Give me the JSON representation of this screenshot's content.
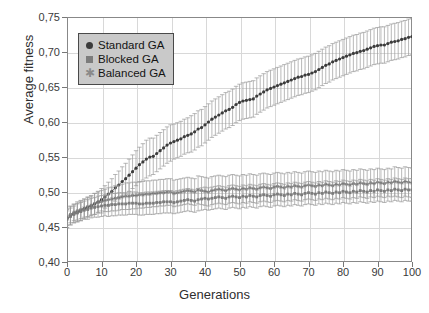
{
  "chart_data": {
    "type": "line",
    "title": "",
    "xlabel": "Generations",
    "ylabel": "Average fitness",
    "xlim": [
      0,
      100
    ],
    "ylim": [
      0.4,
      0.75
    ],
    "xticks": [
      "0",
      "10",
      "20",
      "30",
      "40",
      "50",
      "60",
      "70",
      "80",
      "90",
      "100"
    ],
    "xtick_values": [
      0,
      10,
      20,
      30,
      40,
      50,
      60,
      70,
      80,
      90,
      100
    ],
    "yticks": [
      "0,40",
      "0,45",
      "0,50",
      "0,55",
      "0,60",
      "0,65",
      "0,70",
      "0,75"
    ],
    "ytick_values": [
      0.4,
      0.45,
      0.5,
      0.55,
      0.6,
      0.65,
      0.7,
      0.75
    ],
    "grid": true,
    "decimal_separator": ",",
    "legend_position": "upper-left",
    "legend": [
      {
        "label": "Standard GA",
        "marker": "circle",
        "color": "#3b3b3b"
      },
      {
        "label": "Blocked GA",
        "marker": "square",
        "color": "#7c7c7c"
      },
      {
        "label": "Balanced GA",
        "marker": "star",
        "color": "#8a8a8a"
      }
    ],
    "errorbars": true,
    "x": [
      0,
      1,
      2,
      3,
      4,
      5,
      6,
      7,
      8,
      9,
      10,
      11,
      12,
      13,
      14,
      15,
      16,
      17,
      18,
      19,
      20,
      21,
      22,
      23,
      24,
      25,
      26,
      27,
      28,
      29,
      30,
      31,
      32,
      33,
      34,
      35,
      36,
      37,
      38,
      39,
      40,
      41,
      42,
      43,
      44,
      45,
      46,
      47,
      48,
      49,
      50,
      51,
      52,
      53,
      54,
      55,
      56,
      57,
      58,
      59,
      60,
      61,
      62,
      63,
      64,
      65,
      66,
      67,
      68,
      69,
      70,
      71,
      72,
      73,
      74,
      75,
      76,
      77,
      78,
      79,
      80,
      81,
      82,
      83,
      84,
      85,
      86,
      87,
      88,
      89,
      90,
      91,
      92,
      93,
      94,
      95,
      96,
      97,
      98,
      99,
      100
    ],
    "series": [
      {
        "name": "Standard GA",
        "marker": "circle",
        "color": "#3b3b3b",
        "values": [
          0.462,
          0.466,
          0.469,
          0.471,
          0.473,
          0.476,
          0.478,
          0.48,
          0.483,
          0.486,
          0.489,
          0.493,
          0.497,
          0.501,
          0.506,
          0.51,
          0.515,
          0.519,
          0.524,
          0.529,
          0.534,
          0.539,
          0.543,
          0.547,
          0.55,
          0.551,
          0.555,
          0.559,
          0.563,
          0.567,
          0.57,
          0.572,
          0.574,
          0.576,
          0.579,
          0.581,
          0.583,
          0.586,
          0.59,
          0.592,
          0.596,
          0.6,
          0.604,
          0.607,
          0.61,
          0.613,
          0.616,
          0.618,
          0.621,
          0.625,
          0.628,
          0.63,
          0.631,
          0.632,
          0.633,
          0.637,
          0.64,
          0.643,
          0.646,
          0.648,
          0.65,
          0.652,
          0.654,
          0.656,
          0.658,
          0.66,
          0.662,
          0.664,
          0.665,
          0.667,
          0.668,
          0.67,
          0.672,
          0.675,
          0.678,
          0.681,
          0.683,
          0.686,
          0.688,
          0.69,
          0.692,
          0.694,
          0.696,
          0.698,
          0.699,
          0.701,
          0.702,
          0.704,
          0.706,
          0.708,
          0.709,
          0.71,
          0.71,
          0.712,
          0.714,
          0.715,
          0.716,
          0.718,
          0.719,
          0.721,
          0.722
        ],
        "err_lower": [
          0.013,
          0.013,
          0.013,
          0.013,
          0.014,
          0.014,
          0.014,
          0.014,
          0.015,
          0.015,
          0.016,
          0.016,
          0.017,
          0.018,
          0.019,
          0.02,
          0.021,
          0.022,
          0.023,
          0.024,
          0.025,
          0.025,
          0.026,
          0.027,
          0.027,
          0.026,
          0.026,
          0.026,
          0.026,
          0.026,
          0.026,
          0.025,
          0.025,
          0.025,
          0.025,
          0.025,
          0.026,
          0.026,
          0.026,
          0.026,
          0.026,
          0.026,
          0.026,
          0.026,
          0.026,
          0.026,
          0.026,
          0.026,
          0.026,
          0.026,
          0.026,
          0.026,
          0.026,
          0.026,
          0.026,
          0.026,
          0.026,
          0.026,
          0.026,
          0.026,
          0.026,
          0.026,
          0.026,
          0.026,
          0.026,
          0.026,
          0.026,
          0.026,
          0.026,
          0.026,
          0.026,
          0.026,
          0.026,
          0.026,
          0.026,
          0.026,
          0.026,
          0.026,
          0.026,
          0.026,
          0.026,
          0.026,
          0.026,
          0.026,
          0.026,
          0.026,
          0.026,
          0.026,
          0.026,
          0.026,
          0.026,
          0.026,
          0.026,
          0.026,
          0.026,
          0.026,
          0.026,
          0.026,
          0.026,
          0.026,
          0.026
        ],
        "err_upper": [
          0.013,
          0.013,
          0.013,
          0.013,
          0.014,
          0.014,
          0.014,
          0.014,
          0.015,
          0.015,
          0.016,
          0.016,
          0.017,
          0.018,
          0.019,
          0.02,
          0.021,
          0.022,
          0.023,
          0.024,
          0.025,
          0.025,
          0.026,
          0.027,
          0.027,
          0.026,
          0.026,
          0.026,
          0.026,
          0.026,
          0.026,
          0.025,
          0.025,
          0.025,
          0.025,
          0.025,
          0.026,
          0.026,
          0.026,
          0.026,
          0.026,
          0.026,
          0.026,
          0.026,
          0.026,
          0.026,
          0.026,
          0.026,
          0.026,
          0.026,
          0.026,
          0.026,
          0.026,
          0.026,
          0.026,
          0.026,
          0.026,
          0.026,
          0.026,
          0.026,
          0.026,
          0.026,
          0.026,
          0.026,
          0.026,
          0.026,
          0.026,
          0.026,
          0.026,
          0.026,
          0.026,
          0.026,
          0.026,
          0.026,
          0.026,
          0.026,
          0.026,
          0.026,
          0.026,
          0.026,
          0.026,
          0.026,
          0.026,
          0.026,
          0.026,
          0.026,
          0.026,
          0.026,
          0.026,
          0.026,
          0.026,
          0.026,
          0.026,
          0.026,
          0.026,
          0.026,
          0.026,
          0.026,
          0.026,
          0.026,
          0.026
        ]
      },
      {
        "name": "Balanced GA",
        "marker": "star",
        "color": "#6a6a6a",
        "values": [
          0.464,
          0.468,
          0.471,
          0.473,
          0.475,
          0.477,
          0.479,
          0.481,
          0.483,
          0.485,
          0.486,
          0.488,
          0.489,
          0.49,
          0.491,
          0.492,
          0.493,
          0.494,
          0.494,
          0.495,
          0.495,
          0.496,
          0.496,
          0.497,
          0.497,
          0.498,
          0.498,
          0.499,
          0.499,
          0.5,
          0.5,
          0.498,
          0.499,
          0.5,
          0.501,
          0.502,
          0.501,
          0.5,
          0.503,
          0.502,
          0.501,
          0.5,
          0.502,
          0.503,
          0.504,
          0.503,
          0.502,
          0.504,
          0.505,
          0.504,
          0.503,
          0.505,
          0.504,
          0.506,
          0.505,
          0.504,
          0.506,
          0.507,
          0.506,
          0.505,
          0.507,
          0.508,
          0.507,
          0.506,
          0.508,
          0.507,
          0.509,
          0.508,
          0.507,
          0.509,
          0.51,
          0.509,
          0.508,
          0.51,
          0.509,
          0.511,
          0.51,
          0.509,
          0.511,
          0.51,
          0.512,
          0.511,
          0.51,
          0.512,
          0.511,
          0.513,
          0.512,
          0.511,
          0.513,
          0.512,
          0.514,
          0.513,
          0.512,
          0.514,
          0.513,
          0.515,
          0.514,
          0.513,
          0.515,
          0.514,
          0.513
        ],
        "err_lower": [
          0.012,
          0.012,
          0.012,
          0.013,
          0.013,
          0.013,
          0.014,
          0.014,
          0.015,
          0.015,
          0.016,
          0.016,
          0.017,
          0.017,
          0.018,
          0.018,
          0.018,
          0.019,
          0.019,
          0.019,
          0.019,
          0.019,
          0.019,
          0.019,
          0.019,
          0.019,
          0.019,
          0.019,
          0.019,
          0.019,
          0.019,
          0.019,
          0.019,
          0.019,
          0.019,
          0.019,
          0.019,
          0.019,
          0.02,
          0.02,
          0.02,
          0.02,
          0.02,
          0.02,
          0.02,
          0.02,
          0.02,
          0.02,
          0.02,
          0.02,
          0.02,
          0.02,
          0.02,
          0.02,
          0.02,
          0.02,
          0.02,
          0.02,
          0.02,
          0.02,
          0.02,
          0.02,
          0.02,
          0.02,
          0.02,
          0.02,
          0.02,
          0.02,
          0.02,
          0.02,
          0.02,
          0.02,
          0.02,
          0.02,
          0.02,
          0.02,
          0.02,
          0.02,
          0.02,
          0.02,
          0.02,
          0.02,
          0.02,
          0.02,
          0.02,
          0.02,
          0.02,
          0.02,
          0.02,
          0.02,
          0.02,
          0.02,
          0.02,
          0.02,
          0.02,
          0.021,
          0.021,
          0.021,
          0.021,
          0.021,
          0.021
        ],
        "err_upper": [
          0.012,
          0.012,
          0.012,
          0.013,
          0.013,
          0.013,
          0.014,
          0.014,
          0.015,
          0.015,
          0.016,
          0.016,
          0.017,
          0.017,
          0.018,
          0.018,
          0.018,
          0.019,
          0.019,
          0.019,
          0.019,
          0.019,
          0.019,
          0.019,
          0.019,
          0.019,
          0.019,
          0.019,
          0.019,
          0.019,
          0.019,
          0.019,
          0.019,
          0.019,
          0.019,
          0.019,
          0.019,
          0.019,
          0.02,
          0.02,
          0.02,
          0.02,
          0.02,
          0.02,
          0.02,
          0.02,
          0.02,
          0.02,
          0.02,
          0.02,
          0.02,
          0.02,
          0.02,
          0.02,
          0.02,
          0.02,
          0.02,
          0.02,
          0.02,
          0.02,
          0.02,
          0.02,
          0.02,
          0.02,
          0.02,
          0.02,
          0.02,
          0.02,
          0.02,
          0.02,
          0.02,
          0.02,
          0.02,
          0.02,
          0.02,
          0.02,
          0.02,
          0.02,
          0.02,
          0.02,
          0.02,
          0.02,
          0.02,
          0.02,
          0.02,
          0.02,
          0.02,
          0.02,
          0.02,
          0.02,
          0.02,
          0.02,
          0.02,
          0.02,
          0.02,
          0.021,
          0.021,
          0.021,
          0.021,
          0.021,
          0.021
        ]
      },
      {
        "name": "Blocked GA",
        "marker": "square",
        "color": "#7c7c7c",
        "values": [
          0.461,
          0.465,
          0.468,
          0.47,
          0.472,
          0.474,
          0.475,
          0.477,
          0.478,
          0.479,
          0.48,
          0.481,
          0.481,
          0.482,
          0.482,
          0.483,
          0.483,
          0.483,
          0.484,
          0.484,
          0.484,
          0.483,
          0.483,
          0.484,
          0.484,
          0.484,
          0.485,
          0.485,
          0.486,
          0.486,
          0.486,
          0.485,
          0.486,
          0.487,
          0.488,
          0.489,
          0.488,
          0.487,
          0.489,
          0.49,
          0.491,
          0.49,
          0.491,
          0.492,
          0.493,
          0.492,
          0.491,
          0.493,
          0.494,
          0.493,
          0.492,
          0.494,
          0.493,
          0.495,
          0.494,
          0.493,
          0.495,
          0.496,
          0.495,
          0.494,
          0.496,
          0.497,
          0.496,
          0.495,
          0.497,
          0.496,
          0.498,
          0.497,
          0.496,
          0.498,
          0.499,
          0.498,
          0.497,
          0.499,
          0.498,
          0.5,
          0.499,
          0.498,
          0.5,
          0.499,
          0.501,
          0.5,
          0.499,
          0.501,
          0.5,
          0.502,
          0.501,
          0.5,
          0.502,
          0.501,
          0.503,
          0.502,
          0.501,
          0.503,
          0.502,
          0.504,
          0.503,
          0.502,
          0.504,
          0.503,
          0.503
        ],
        "err_lower": [
          0.012,
          0.012,
          0.012,
          0.013,
          0.013,
          0.013,
          0.014,
          0.014,
          0.014,
          0.015,
          0.015,
          0.015,
          0.016,
          0.016,
          0.016,
          0.016,
          0.016,
          0.016,
          0.016,
          0.016,
          0.016,
          0.016,
          0.016,
          0.016,
          0.016,
          0.016,
          0.016,
          0.016,
          0.016,
          0.016,
          0.016,
          0.016,
          0.016,
          0.016,
          0.016,
          0.016,
          0.016,
          0.016,
          0.016,
          0.016,
          0.016,
          0.016,
          0.016,
          0.016,
          0.016,
          0.016,
          0.016,
          0.016,
          0.016,
          0.016,
          0.016,
          0.016,
          0.016,
          0.016,
          0.016,
          0.016,
          0.016,
          0.016,
          0.016,
          0.016,
          0.016,
          0.016,
          0.016,
          0.016,
          0.016,
          0.016,
          0.016,
          0.016,
          0.016,
          0.016,
          0.016,
          0.016,
          0.016,
          0.016,
          0.016,
          0.016,
          0.016,
          0.016,
          0.016,
          0.016,
          0.016,
          0.016,
          0.016,
          0.016,
          0.016,
          0.016,
          0.016,
          0.016,
          0.016,
          0.016,
          0.016,
          0.016,
          0.016,
          0.016,
          0.016,
          0.016,
          0.016,
          0.016,
          0.016,
          0.016,
          0.016
        ],
        "err_upper": [
          0.012,
          0.012,
          0.012,
          0.013,
          0.013,
          0.013,
          0.014,
          0.014,
          0.014,
          0.015,
          0.015,
          0.015,
          0.016,
          0.016,
          0.016,
          0.016,
          0.016,
          0.016,
          0.016,
          0.016,
          0.016,
          0.016,
          0.016,
          0.016,
          0.016,
          0.016,
          0.016,
          0.016,
          0.016,
          0.016,
          0.016,
          0.016,
          0.016,
          0.016,
          0.016,
          0.016,
          0.016,
          0.016,
          0.016,
          0.016,
          0.016,
          0.016,
          0.016,
          0.016,
          0.016,
          0.016,
          0.016,
          0.016,
          0.016,
          0.016,
          0.016,
          0.016,
          0.016,
          0.016,
          0.016,
          0.016,
          0.016,
          0.016,
          0.016,
          0.016,
          0.016,
          0.016,
          0.016,
          0.016,
          0.016,
          0.016,
          0.016,
          0.016,
          0.016,
          0.016,
          0.016,
          0.016,
          0.016,
          0.016,
          0.016,
          0.016,
          0.016,
          0.016,
          0.016,
          0.016,
          0.016,
          0.016,
          0.016,
          0.016,
          0.016,
          0.016,
          0.016,
          0.016,
          0.016,
          0.016,
          0.016,
          0.016,
          0.016,
          0.016,
          0.016,
          0.016,
          0.016,
          0.016,
          0.016,
          0.016,
          0.016
        ]
      }
    ]
  },
  "colors": {
    "grid": "#d8d8d8",
    "frame": "#888888",
    "text": "#2e2e2e",
    "legend_bg": "#c9c9c9",
    "legend_border": "#4a4a4a"
  }
}
